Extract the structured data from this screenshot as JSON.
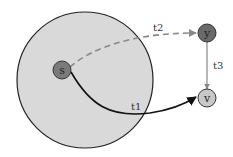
{
  "diagram": {
    "region": {
      "label": "",
      "fill": "#d9d9d9",
      "stroke": "#222222"
    },
    "nodes": [
      {
        "id": "s",
        "label": "s",
        "fill": "#7a7a7a"
      },
      {
        "id": "y",
        "label": "y",
        "fill": "#6a6a6a"
      },
      {
        "id": "v",
        "label": "v",
        "fill": "#c8c8c8"
      }
    ],
    "edges": [
      {
        "id": "t1",
        "from": "s",
        "to": "v",
        "label": "t1",
        "style": "solid",
        "color": "#111111"
      },
      {
        "id": "t2",
        "from": "s",
        "to": "y",
        "label": "t2",
        "style": "dashed",
        "color": "#888888"
      },
      {
        "id": "t3",
        "from": "y",
        "to": "v",
        "label": "t3",
        "style": "solid",
        "color": "#888888"
      }
    ]
  }
}
